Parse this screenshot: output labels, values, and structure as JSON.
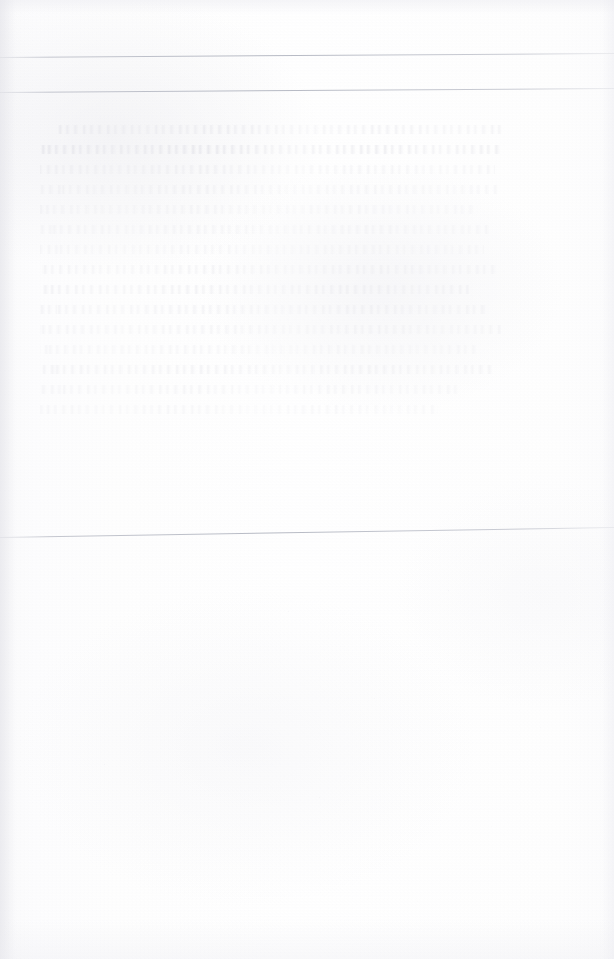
{
  "page": {
    "width": 614,
    "height": 959,
    "kind": "faded-scanned-document-page",
    "legible_text": "none",
    "note_for_reader": "All printed content on this page is faded to the threshold of visibility; no characters, words, numbers, headings or captions can be resolved at any magnification. Only structural hairline rules and the rhythm of ghosted text lines remain readable as shapes.",
    "colors": {
      "paper_white": "#ffffff",
      "paper_base": "#fefefe",
      "paper_shadow": "#f7f7f8",
      "rule_stroke": "#aaaeba",
      "ghost_text_stroke": "#ced0d8"
    }
  },
  "rules": [
    {
      "name": "upper-rule-first",
      "y_left": 57,
      "y_right": 53,
      "x_start": 0,
      "x_end": 614,
      "thickness": 1
    },
    {
      "name": "upper-rule-second",
      "y_left": 92,
      "y_right": 88,
      "x_start": 0,
      "x_end": 614,
      "thickness": 1
    },
    {
      "name": "middle-rule",
      "y_left": 537,
      "y_right": 527,
      "x_start": 0,
      "x_end": 614,
      "thickness": 1
    }
  ],
  "ghost_text_block": {
    "name": "upper-ghost-paragraph-block",
    "left": 40,
    "right": 505,
    "top": 125,
    "bottom": 420,
    "line_height": 20,
    "legible": false,
    "lines": [
      {
        "indent": 18,
        "width": 447,
        "strength": 0.4
      },
      {
        "indent": 0,
        "width": 462,
        "strength": 0.55
      },
      {
        "indent": 0,
        "width": 455,
        "strength": 0.3
      },
      {
        "indent": 0,
        "width": 460,
        "strength": 0.26
      },
      {
        "indent": 0,
        "width": 438,
        "strength": 0.22
      },
      {
        "indent": 0,
        "width": 451,
        "strength": 0.24
      },
      {
        "indent": 0,
        "width": 444,
        "strength": 0.2
      },
      {
        "indent": 0,
        "width": 457,
        "strength": 0.28
      },
      {
        "indent": 0,
        "width": 430,
        "strength": 0.34
      },
      {
        "indent": 0,
        "width": 449,
        "strength": 0.3
      },
      {
        "indent": 0,
        "width": 461,
        "strength": 0.26
      },
      {
        "indent": 0,
        "width": 436,
        "strength": 0.22
      },
      {
        "indent": 0,
        "width": 452,
        "strength": 0.32
      },
      {
        "indent": 0,
        "width": 420,
        "strength": 0.24
      },
      {
        "indent": 0,
        "width": 398,
        "strength": 0.2
      }
    ]
  },
  "lower_region": {
    "name": "lower-blank-region",
    "top": 545,
    "bottom": 959,
    "content": "blank",
    "note": "No rules and no resolvable text; only faint scanner speckle and paper mottling."
  }
}
